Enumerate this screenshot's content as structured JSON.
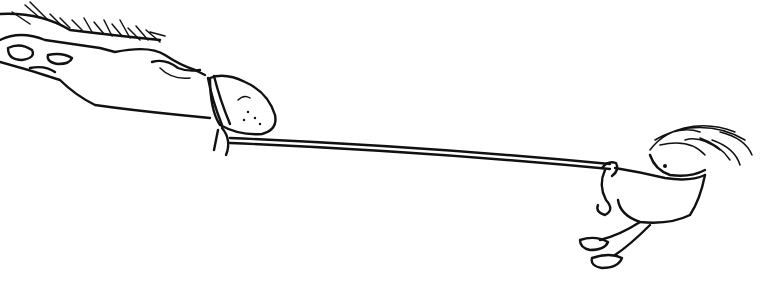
{
  "scene": {
    "description": "Line drawing of a small child pulling a large horse by a rope",
    "style": "black ink sketch on white",
    "colors": {
      "ink": "#111111",
      "background": "#ffffff"
    },
    "subjects": [
      {
        "id": "horse",
        "label": "horse head with halter"
      },
      {
        "id": "rope",
        "label": "rope"
      },
      {
        "id": "child",
        "label": "child holding rope"
      }
    ]
  }
}
